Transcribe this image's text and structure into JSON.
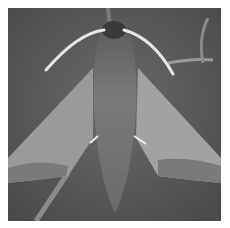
{
  "image": {
    "subject": "hawk moth on a plant stem",
    "style": "grayscale photograph",
    "colors": {
      "background": "#5a5a5a",
      "border": "#ffffff",
      "wing_light": "#a8a8a8",
      "wing_band": "#7a7a7a",
      "body": "#6e6e6e",
      "antenna": "#e6e6e6"
    }
  }
}
